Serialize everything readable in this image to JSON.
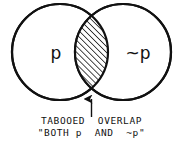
{
  "diagram": {
    "type": "venn-two-circle",
    "background_color": "#ffffff",
    "stroke_color": "#111111",
    "hatch_color": "#111111",
    "circles": [
      {
        "id": "left",
        "label": "p",
        "center_x": 60,
        "center_y": 52,
        "radius": 48,
        "fill": "#ffffff"
      },
      {
        "id": "right",
        "label": "~p",
        "center_x": 123,
        "center_y": 52,
        "radius": 48,
        "fill": "#ffffff"
      }
    ],
    "overlap": {
      "name": "tabooed-overlap",
      "fill_pattern": "diagonal-hatch",
      "hatch_angle_deg": 45,
      "hatch_spacing_px": 3,
      "top_y": 20,
      "bottom_y": 87
    },
    "arrow": {
      "name": "overlap-pointer",
      "direction": "up",
      "x": 91,
      "tail_y": 117,
      "head_y": 99
    }
  },
  "labels": {
    "left_circle": "p",
    "right_circle": "~p"
  },
  "caption": {
    "line1": "TABOOED  OVERLAP",
    "line2": "\"BOTH p  AND  ~p\""
  }
}
